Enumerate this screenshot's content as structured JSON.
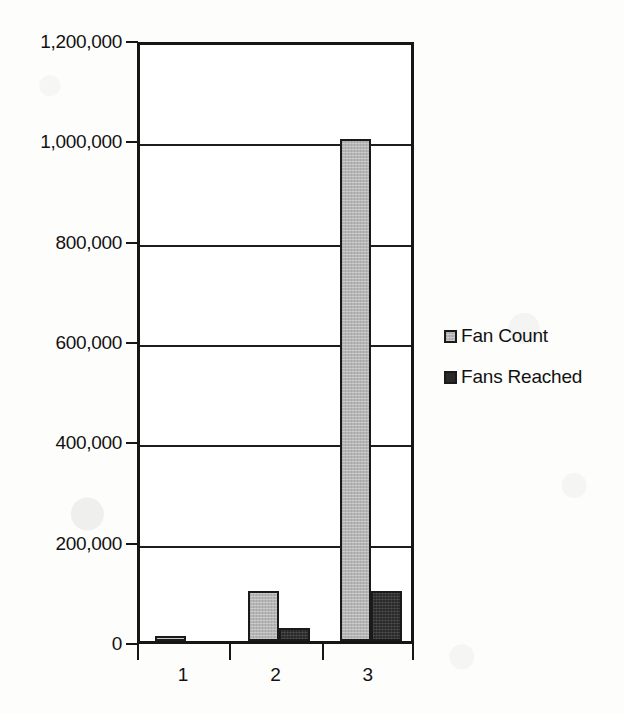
{
  "chart_data": {
    "type": "bar",
    "title": "",
    "subtitle": "",
    "xlabel": "",
    "ylabel": "",
    "categories": [
      "1",
      "2",
      "3"
    ],
    "series": [
      {
        "name": "Fan Count",
        "color": "#b5b5b5",
        "values": [
          10000,
          100000,
          1000000
        ]
      },
      {
        "name": "Fans Reached",
        "color": "#2a2a2a",
        "values": [
          0,
          25000,
          100000
        ]
      }
    ],
    "ylim": [
      0,
      1200000
    ],
    "ytick_values": [
      0,
      200000,
      400000,
      600000,
      800000,
      1000000,
      1200000
    ],
    "ytick_labels": [
      "0",
      "200,000",
      "400,000",
      "600,000",
      "800,000",
      "1,000,000",
      "1,200,000"
    ],
    "xtick_labels": [
      "1",
      "2",
      "3"
    ],
    "grid": true,
    "grid_axis": "y",
    "legend_position": "right",
    "legend_entries": [
      "Fan Count",
      "Fans Reached"
    ],
    "frame": true,
    "background_color": "#ffffff",
    "axis_color": "#161616"
  }
}
